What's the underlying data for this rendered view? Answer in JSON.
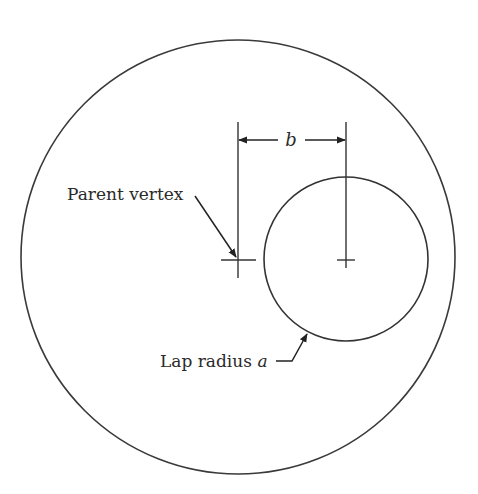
{
  "diagram": {
    "labels": {
      "b": "b",
      "parent_vertex": "Parent vertex",
      "lap_radius": "Lap radius ",
      "lap_radius_var": "a"
    },
    "outer_circle": {
      "cx": 238,
      "cy": 257,
      "r": 217
    },
    "inner_circle": {
      "cx": 346,
      "cy": 259,
      "r": 82
    },
    "colors": {
      "stroke": "#333333"
    }
  }
}
